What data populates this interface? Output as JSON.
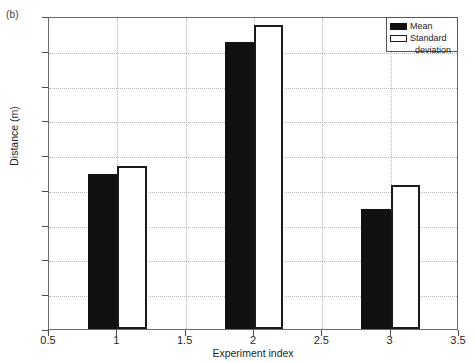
{
  "panel": {
    "label": "(b)"
  },
  "chart_data": {
    "type": "bar",
    "title": "",
    "xlabel": "Experiment index",
    "ylabel": "Distance (m)",
    "xlim": [
      0.5,
      3.5
    ],
    "ylim": [
      0,
      9
    ],
    "grid": true,
    "legend_position": "top-right",
    "xticks": [
      0.5,
      1,
      1.5,
      2,
      2.5,
      3,
      3.5
    ],
    "xtick_labels": [
      "0.5",
      "1",
      "1.5",
      "2",
      "2.5",
      "3",
      "3.5"
    ],
    "yticks": [
      0,
      1,
      2,
      3,
      4,
      5,
      6,
      7,
      8,
      9
    ],
    "ytick_labels": [
      "0",
      "1",
      "2",
      "3",
      "4",
      "5",
      "6",
      "7",
      "8",
      "9"
    ],
    "categories": [
      1,
      2,
      3
    ],
    "series": [
      {
        "name": "Mean",
        "values": [
          4.45,
          8.25,
          3.45
        ],
        "color": "#111111",
        "fill": "solid"
      },
      {
        "name": "Standard deviation",
        "values": [
          4.7,
          8.75,
          4.13
        ],
        "color": "#ffffff",
        "fill": "outline"
      }
    ]
  },
  "legend": {
    "entries": [
      {
        "label": "Mean",
        "label2": ""
      },
      {
        "label": "Standard",
        "label2": "deviation"
      }
    ]
  }
}
